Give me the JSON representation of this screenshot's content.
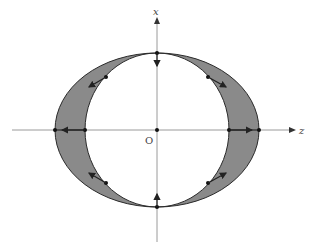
{
  "diagram": {
    "labels": {
      "origin": "O",
      "vertical_axis": "x",
      "horizontal_axis": "z"
    },
    "colors": {
      "ring_fill": "#8a8a8a",
      "outline": "#2a2a2a",
      "axis": "#9a9a9a",
      "background": "#ffffff"
    }
  }
}
